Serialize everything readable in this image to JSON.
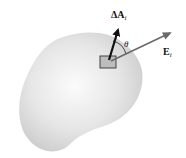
{
  "figure": {
    "surface": {
      "fill_center": "#fafafa",
      "fill_edge": "#cfcfcf"
    },
    "area_element": {
      "fill": "#bdbdbd",
      "stroke": "#333333"
    },
    "normal_vector": {
      "label": "ΔA",
      "subscript": "i",
      "color": "#111111"
    },
    "field_vector": {
      "label": "E",
      "subscript": "i",
      "color": "#6a6a6a"
    },
    "angle": {
      "label": "θ"
    }
  }
}
